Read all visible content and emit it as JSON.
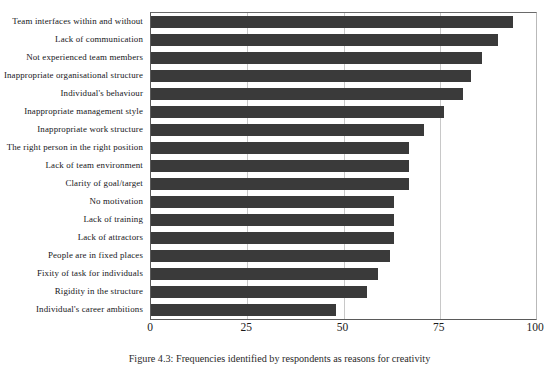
{
  "figure": {
    "caption": "Figure 4.3: Frequencies identified by respondents as reasons for creativity"
  },
  "chart_data": {
    "type": "bar",
    "orientation": "horizontal",
    "title": "",
    "xlabel": "",
    "ylabel": "",
    "xlim": [
      0,
      100
    ],
    "xticks": [
      0,
      25,
      50,
      75,
      100
    ],
    "xtick_labels": [
      "0",
      "25",
      "50",
      "75",
      "100"
    ],
    "grid": true,
    "grid_axis": "x",
    "legend": "none",
    "bar_color": "#3a3a3a",
    "categories": [
      "Team interfaces within and without",
      "Lack of communication",
      "Not experienced team members",
      "Inappropriate organisational structure",
      "Individual's behaviour",
      "Inappropriate management style",
      "Inappropriate work structure",
      "The right person in the right position",
      "Lack of team environment",
      "Clarity of goal/target",
      "No motivation",
      "Lack of training",
      "Lack of attractors",
      "People are in fixed places",
      "Fixity of task for individuals",
      "Rigidity in the structure",
      "Individual's career ambitions"
    ],
    "values": [
      94,
      90,
      86,
      83,
      81,
      76,
      71,
      67,
      67,
      67,
      63,
      63,
      63,
      62,
      59,
      56,
      48
    ]
  }
}
